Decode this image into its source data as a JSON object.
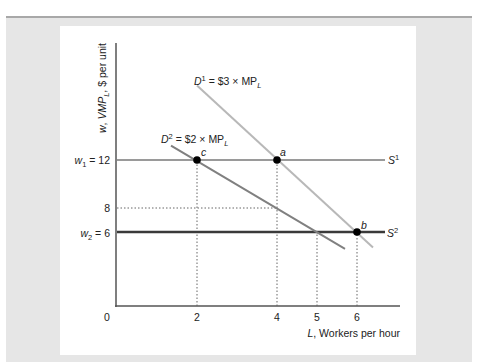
{
  "chart_data": {
    "type": "line",
    "title": "",
    "xlabel_var": "L",
    "xlabel_rest": ", Workers per hour",
    "ylabel": "w, VMP_L, $ per unit",
    "ylabel_parts": {
      "w": "w",
      "sep": ", ",
      "vmp": "VMP",
      "sub": "L",
      "rest": ", $ per unit"
    },
    "x_ticks": [
      {
        "value": 0,
        "label": "0"
      },
      {
        "value": 2,
        "label": "2"
      },
      {
        "value": 4,
        "label": "4"
      },
      {
        "value": 5,
        "label": "5"
      },
      {
        "value": 6,
        "label": "6"
      }
    ],
    "y_ticks": [
      {
        "value": 12,
        "label": "w₁ = 12",
        "var": "w",
        "sub": "1",
        "rest": " = 12"
      },
      {
        "value": 8,
        "label": "8"
      },
      {
        "value": 6,
        "label": "w₂ = 6",
        "var": "w",
        "sub": "2",
        "rest": " = 6"
      }
    ],
    "xlim": [
      0,
      7
    ],
    "ylim": [
      0,
      19
    ],
    "grid": false,
    "series": [
      {
        "name": "D1 = $3 × MP_L",
        "label_main": "D",
        "label_sup": "1",
        "label_rest": " = $3 × MP",
        "label_sub": "L",
        "color": "#b8b8b8",
        "points": [
          [
            2,
            18.2
          ],
          [
            6.4,
            4.7
          ]
        ]
      },
      {
        "name": "D2 = $2 × MP_L",
        "label_main": "D",
        "label_sup": "2",
        "label_rest": " = $2 × MP",
        "label_sub": "L",
        "color": "#808080",
        "points": [
          [
            1.35,
            13.2
          ],
          [
            5.7,
            4.6
          ]
        ]
      },
      {
        "name": "S1",
        "label_main": "S",
        "label_sup": "1",
        "color": "#9a9a9a",
        "points": [
          [
            0,
            12
          ],
          [
            6.7,
            12
          ]
        ]
      },
      {
        "name": "S2",
        "label_main": "S",
        "label_sup": "2",
        "color": "#3a3a3a",
        "points": [
          [
            0,
            6
          ],
          [
            6.7,
            6
          ]
        ]
      }
    ],
    "points": [
      {
        "name": "c",
        "x": 2,
        "y": 12
      },
      {
        "name": "a",
        "x": 4,
        "y": 12
      },
      {
        "name": "b",
        "x": 6,
        "y": 6
      }
    ],
    "reference_lines": [
      {
        "type": "vertical",
        "x": 2,
        "from_y": 0,
        "to_y": 12
      },
      {
        "type": "vertical",
        "x": 4,
        "from_y": 0,
        "to_y": 12
      },
      {
        "type": "vertical",
        "x": 5,
        "from_y": 0,
        "to_y": 6
      },
      {
        "type": "vertical",
        "x": 6,
        "from_y": 0,
        "to_y": 6
      },
      {
        "type": "horizontal",
        "y": 8,
        "from_x": 0,
        "to_x": 4
      }
    ]
  }
}
